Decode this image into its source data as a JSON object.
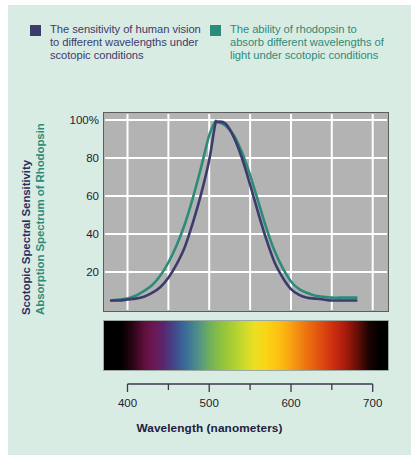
{
  "legend": {
    "entries": [
      {
        "label": "The sensitivity of human vision to different wavelengths under scotopic conditions",
        "color": "#3b3b6d",
        "swatch_name": "legend-swatch-scotopic-sensitivity"
      },
      {
        "label": "The ability of rhodopsin to absorb different wavelengths of light under scotopic conditions",
        "color": "#2d8b79",
        "swatch_name": "legend-swatch-rhodopsin-absorption"
      }
    ]
  },
  "axes": {
    "y_title_primary": "Scotopic Spectral Sensitivity",
    "y_title_secondary": "Absorption Spectrum of Rhodopsin",
    "y_title_primary_color": "#2c2c5e",
    "y_title_secondary_color": "#2d8b79",
    "x_title": "Wavelength (nanometers)",
    "y_ticks": [
      "100%",
      "80",
      "60",
      "40",
      "20"
    ],
    "x_ticks": [
      "400",
      "500",
      "600",
      "700"
    ]
  },
  "spectrum": {
    "name": "visible-light-spectrum-bar",
    "description": "Visible light spectrum from violet through red"
  },
  "chart_data": {
    "type": "line",
    "title": "",
    "xlabel": "Wavelength (nanometers)",
    "ylabel": "Scotopic Spectral Sensitivity / Absorption Spectrum of Rhodopsin",
    "xlim": [
      370,
      720
    ],
    "ylim": [
      0,
      108
    ],
    "ytick_values": [
      100,
      80,
      60,
      40,
      20
    ],
    "ytick_labels": [
      "100%",
      "80",
      "60",
      "40",
      "20"
    ],
    "xtick_values": [
      400,
      500,
      600,
      700
    ],
    "xtick_labels": [
      "400",
      "500",
      "600",
      "700"
    ],
    "xtick_minor_values": [
      450,
      550,
      650
    ],
    "grid": true,
    "grid_color": "#ffffff",
    "plot_background": "#b3b3b3",
    "legend_position": "above-plot",
    "series": [
      {
        "name": "Scotopic spectral sensitivity of human vision",
        "color": "#3b3b6d",
        "peak_wavelength": 507,
        "x": [
          380,
          390,
          400,
          410,
          420,
          430,
          440,
          450,
          460,
          470,
          480,
          490,
          500,
          507,
          510,
          520,
          530,
          540,
          550,
          560,
          570,
          580,
          590,
          600,
          610,
          620,
          630,
          640,
          650,
          660,
          670,
          680
        ],
        "values": [
          5,
          5,
          5.5,
          6,
          7,
          9,
          12,
          17,
          24,
          33,
          46,
          61,
          79,
          97,
          99,
          98,
          91,
          80,
          66,
          51,
          37,
          25,
          17,
          11,
          8,
          6.5,
          6,
          5.5,
          5,
          5,
          5,
          5
        ]
      },
      {
        "name": "Absorption spectrum of rhodopsin",
        "color": "#2d8b79",
        "peak_wavelength": 500,
        "x": [
          380,
          390,
          400,
          410,
          420,
          430,
          440,
          450,
          460,
          470,
          480,
          490,
          500,
          507,
          510,
          520,
          530,
          540,
          550,
          560,
          570,
          580,
          590,
          600,
          610,
          620,
          630,
          640,
          650,
          660,
          670,
          680
        ],
        "values": [
          5,
          5.5,
          6,
          7.5,
          10,
          13,
          18,
          25,
          34,
          45,
          59,
          75,
          92,
          99,
          99,
          97,
          92,
          83,
          71,
          57,
          43,
          31,
          22,
          15,
          11,
          9,
          7.5,
          7,
          6.5,
          6.5,
          6.5,
          6.5
        ]
      }
    ]
  }
}
